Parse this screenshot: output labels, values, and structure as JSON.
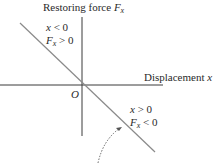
{
  "diagram": {
    "y_axis_label": "Restoring force ",
    "y_axis_var": "F",
    "y_axis_sub": "x",
    "x_axis_label": "Displacement ",
    "x_axis_var": "x",
    "origin": "O",
    "region_left": {
      "line1_var": "x",
      "line1_rel": " < 0",
      "line2_var": "F",
      "line2_sub": "x",
      "line2_rel": " > 0"
    },
    "region_right": {
      "line1_var": "x",
      "line1_rel": " > 0",
      "line2_var": "F",
      "line2_sub": "x",
      "line2_rel": " < 0"
    },
    "colors": {
      "axis": "#3a3a3a",
      "line": "#8a8a8a",
      "text": "#2a2a2a"
    }
  }
}
